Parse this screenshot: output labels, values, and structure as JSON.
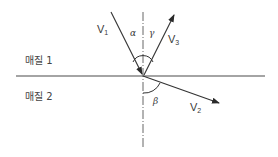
{
  "diagram": {
    "type": "wave refraction/reflection at interface",
    "media": [
      {
        "label": "매질 1"
      },
      {
        "label": "매질 2"
      }
    ],
    "vectors": [
      {
        "id": "V1",
        "base": "V",
        "subscript": "1",
        "role": "incident"
      },
      {
        "id": "V3",
        "base": "V",
        "subscript": "3",
        "role": "reflected"
      },
      {
        "id": "V2",
        "base": "V",
        "subscript": "2",
        "role": "refracted"
      }
    ],
    "angles": [
      {
        "symbol": "α",
        "between": "V1 and normal"
      },
      {
        "symbol": "γ",
        "between": "V3 and normal"
      },
      {
        "symbol": "β",
        "between": "V2 and normal"
      }
    ],
    "colors": {
      "stroke": "#3a3a3a",
      "background": "#ffffff"
    }
  }
}
